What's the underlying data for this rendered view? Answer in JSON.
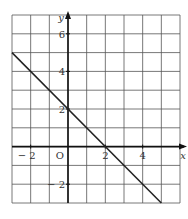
{
  "chart_data": {
    "type": "line",
    "title": "",
    "xlabel": "x",
    "ylabel": "y",
    "origin_label": "O",
    "xlim": [
      -3,
      6
    ],
    "ylim": [
      -3,
      7
    ],
    "grid": true,
    "x_ticks": [
      -2,
      2,
      4
    ],
    "y_ticks": [
      -2,
      2,
      4,
      6
    ],
    "x_tick_labels": [
      "− 2",
      "2",
      "4"
    ],
    "y_tick_labels": [
      "− 2",
      "2",
      "4",
      "6"
    ],
    "series": [
      {
        "name": "y = 2 − x",
        "x": [
          -3,
          5
        ],
        "y": [
          5,
          -3
        ],
        "color": "#222222"
      }
    ],
    "legend": null
  }
}
